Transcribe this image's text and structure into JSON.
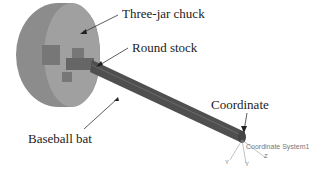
{
  "labels": {
    "chuck": "Three-jar chuck",
    "stock": "Round stock",
    "bat": "Baseball bat",
    "coordinate": "Coordinate",
    "coord_system": "Coordinate System1",
    "axes": {
      "x": "X",
      "y": "Y",
      "z": "Z"
    }
  },
  "colors": {
    "chuck": "#8a8a8a",
    "bat": "#5a5a5a",
    "text": "#222222"
  }
}
